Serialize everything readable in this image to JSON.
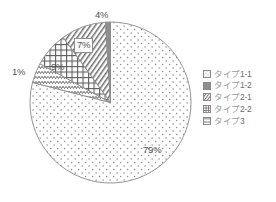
{
  "chart_data": {
    "type": "pie",
    "title": "",
    "categories": [
      "タイプ1-1",
      "タイプ1-2",
      "タイプ2-1",
      "タイプ2-2",
      "タイプ3"
    ],
    "values": [
      79,
      1,
      9,
      7,
      4
    ],
    "value_labels": [
      "79%",
      "1%",
      "9%",
      "7%",
      "4%"
    ],
    "units": "percent",
    "total": 100,
    "start_angle_deg": 0,
    "direction": "clockwise",
    "legend_position": "right",
    "grid": false,
    "slices": [
      {
        "label": "タイプ1-1",
        "value": 79,
        "value_label": "79%",
        "pattern": "dots",
        "label_placement": "inside"
      },
      {
        "label": "タイプ1-2",
        "value": 1,
        "value_label": "1%",
        "pattern": "solid-dark",
        "label_placement": "outside-left"
      },
      {
        "label": "タイプ2-1",
        "value": 9,
        "value_label": "9%",
        "pattern": "diagonal-stripes",
        "label_placement": "inside"
      },
      {
        "label": "タイプ2-2",
        "value": 7,
        "value_label": "7%",
        "pattern": "cross-hatch",
        "label_placement": "inside-boxed"
      },
      {
        "label": "タイプ3",
        "value": 4,
        "value_label": "4%",
        "pattern": "wavy",
        "label_placement": "outside-top"
      }
    ],
    "colors": {
      "outline": "#8a8a8a",
      "pattern_ink": "#6e6e6e",
      "slice_background": "#ffffff",
      "solid_dark_fill": "#8f8f8f",
      "label_text": "#555555",
      "legend_text": "#6f6f6f"
    }
  },
  "labels": {
    "top": "4%",
    "crosshatch": "7%",
    "stripes": "9%",
    "left": "1%",
    "dots": "79%"
  },
  "legend": {
    "items": [
      {
        "label": "タイプ1-1",
        "pattern": "dots"
      },
      {
        "label": "タイプ1-2",
        "pattern": "solid-dark"
      },
      {
        "label": "タイプ2-1",
        "pattern": "diagonal-stripes"
      },
      {
        "label": "タイプ2-2",
        "pattern": "cross-hatch"
      },
      {
        "label": "タイプ3",
        "pattern": "wavy"
      }
    ]
  }
}
